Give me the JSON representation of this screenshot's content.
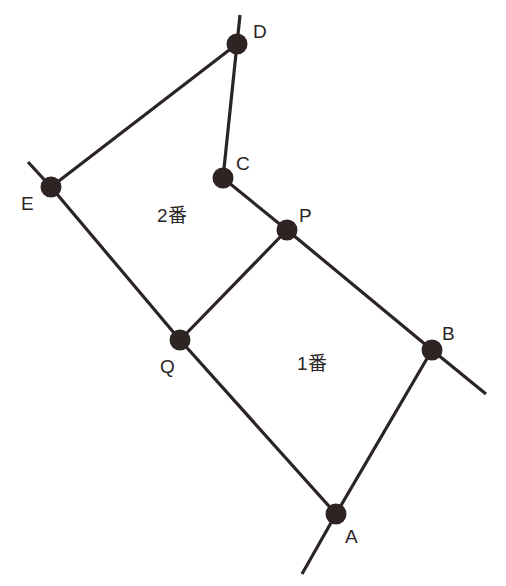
{
  "diagram": {
    "type": "node-link network",
    "colors": {
      "background": "#ffffff",
      "edge": "#2b2424",
      "node": "#2e2424",
      "text": "#2b2626"
    },
    "nodes": [
      {
        "id": "D",
        "label": "D",
        "x": 237,
        "y": 44,
        "label_x": 253,
        "label_y": 38
      },
      {
        "id": "E",
        "label": "E",
        "x": 51,
        "y": 187,
        "label_x": 21,
        "label_y": 210
      },
      {
        "id": "C",
        "label": "C",
        "x": 223,
        "y": 178,
        "label_x": 236,
        "label_y": 170
      },
      {
        "id": "P",
        "label": "P",
        "x": 287,
        "y": 230,
        "label_x": 299,
        "label_y": 222
      },
      {
        "id": "Q",
        "label": "Q",
        "x": 180,
        "y": 340,
        "label_x": 160,
        "label_y": 373
      },
      {
        "id": "B",
        "label": "B",
        "x": 432,
        "y": 350,
        "label_x": 442,
        "label_y": 340
      },
      {
        "id": "A",
        "label": "A",
        "x": 336,
        "y": 514,
        "label_x": 345,
        "label_y": 543
      }
    ],
    "edges": [
      {
        "from": "D",
        "to": "E"
      },
      {
        "from": "D",
        "to": "C"
      },
      {
        "from": "C",
        "to": "P"
      },
      {
        "from": "P",
        "to": "B"
      },
      {
        "from": "P",
        "to": "Q"
      },
      {
        "from": "E",
        "to": "Q"
      },
      {
        "from": "Q",
        "to": "A"
      },
      {
        "from": "B",
        "to": "A"
      }
    ],
    "stubs": [
      {
        "from": "D",
        "x2": 240,
        "y2": 15
      },
      {
        "from": "E",
        "x2": 28,
        "y2": 162
      },
      {
        "from": "B",
        "x2": 486,
        "y2": 394
      },
      {
        "from": "A",
        "x2": 302,
        "y2": 574
      }
    ],
    "regions": [
      {
        "id": "region-2",
        "label": "2番",
        "x": 157,
        "y": 222
      },
      {
        "id": "region-1",
        "label": "1番",
        "x": 297,
        "y": 370
      }
    ]
  }
}
